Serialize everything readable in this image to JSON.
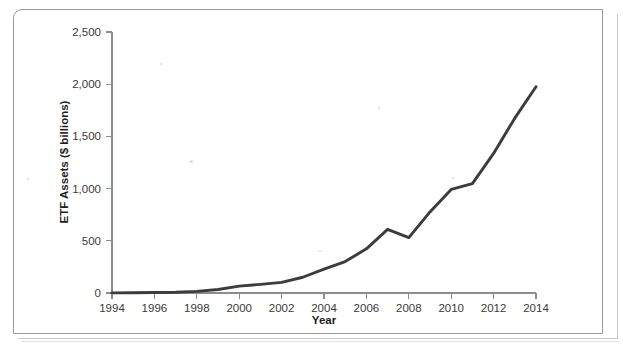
{
  "page": {
    "clipped_header_text": "",
    "background_color": "#ffffff"
  },
  "figure": {
    "border_color": "#9a9a9a"
  },
  "chart_data": {
    "type": "line",
    "title": "",
    "xlabel": "Year",
    "ylabel": "ETF Assets ($ billions)",
    "xlim": [
      1994,
      2014
    ],
    "ylim": [
      0,
      2500
    ],
    "xticks": [
      1994,
      1996,
      1998,
      2000,
      2002,
      2004,
      2006,
      2008,
      2010,
      2012,
      2014
    ],
    "xtick_labels": [
      "1994",
      "1996",
      "1998",
      "2000",
      "2002",
      "2004",
      "2006",
      "2008",
      "2010",
      "2012",
      "2014"
    ],
    "yticks": [
      0,
      500,
      1000,
      1500,
      2000,
      2500
    ],
    "ytick_labels": [
      "0",
      "500",
      "1,000",
      "1,500",
      "2,000",
      "2,500"
    ],
    "grid": false,
    "legend": false,
    "line_color": "#3c3c3c",
    "line_width": 2.9,
    "x": [
      1994,
      1995,
      1996,
      1997,
      1998,
      1999,
      2000,
      2001,
      2002,
      2003,
      2004,
      2005,
      2006,
      2007,
      2008,
      2009,
      2010,
      2011,
      2012,
      2013,
      2014
    ],
    "values": [
      1,
      2,
      5,
      7,
      16,
      34,
      66,
      83,
      102,
      151,
      228,
      301,
      423,
      610,
      531,
      777,
      992,
      1048,
      1337,
      1675,
      1975
    ],
    "series": [
      {
        "name": "ETF Assets",
        "values": [
          1,
          2,
          5,
          7,
          16,
          34,
          66,
          83,
          102,
          151,
          228,
          301,
          423,
          610,
          531,
          777,
          992,
          1048,
          1337,
          1675,
          1975
        ]
      }
    ],
    "annotations": []
  }
}
